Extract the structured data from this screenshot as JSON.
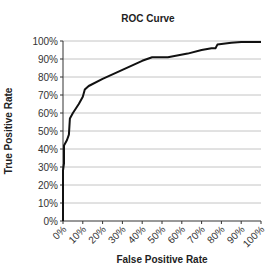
{
  "chart_data": {
    "type": "line",
    "title": "ROC Curve",
    "xlabel": "False Positive Rate",
    "ylabel": "True Positive Rate",
    "xlim": [
      0,
      100
    ],
    "ylim": [
      0,
      100
    ],
    "grid": "horizontal",
    "legend": "none",
    "x_ticks": [
      "0%",
      "10%",
      "20%",
      "30%",
      "40%",
      "50%",
      "60%",
      "70%",
      "80%",
      "90%",
      "100%"
    ],
    "y_ticks": [
      "0%",
      "10%",
      "20%",
      "30%",
      "40%",
      "50%",
      "60%",
      "70%",
      "80%",
      "90%",
      "100%"
    ],
    "x_tick_values": [
      0,
      10,
      20,
      30,
      40,
      50,
      60,
      70,
      80,
      90,
      100
    ],
    "y_tick_values": [
      0,
      10,
      20,
      30,
      40,
      50,
      60,
      70,
      80,
      90,
      100
    ],
    "series": [
      {
        "name": "ROC",
        "color": "#111111",
        "x": [
          0,
          0,
          0.5,
          0.5,
          2,
          3,
          3.5,
          5,
          8,
          10,
          11,
          13,
          20,
          30,
          40,
          45,
          53,
          63,
          70,
          75,
          77,
          78,
          85,
          90,
          100
        ],
        "y": [
          0,
          28,
          32,
          42,
          45,
          48,
          57,
          60,
          65,
          69,
          73,
          75,
          79,
          84,
          89,
          91,
          91,
          93,
          95,
          96,
          96,
          98,
          99,
          99.5,
          99.5
        ]
      }
    ]
  }
}
